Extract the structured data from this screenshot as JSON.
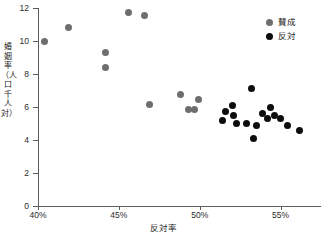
{
  "chart_data": {
    "type": "scatter",
    "title": "",
    "xlabel": "反対率",
    "ylabel": "婚姻率（人口千人対）",
    "xlim": [
      40,
      57.5
    ],
    "ylim": [
      0,
      12
    ],
    "grid": false,
    "legend_position": "top-right",
    "x_ticks": [
      "40%",
      "45%",
      "50%",
      "55%"
    ],
    "x_tick_values": [
      40,
      45,
      50,
      55
    ],
    "y_ticks": [
      "0",
      "2",
      "4",
      "6",
      "8",
      "10",
      "12"
    ],
    "y_tick_values": [
      0,
      2,
      4,
      6,
      8,
      10,
      12
    ],
    "series": [
      {
        "name": "賛成",
        "color": "#6e6e6e",
        "marker": "circle",
        "points": [
          {
            "x": 40.4,
            "y": 10.0
          },
          {
            "x": 41.9,
            "y": 10.8
          },
          {
            "x": 44.2,
            "y": 9.3
          },
          {
            "x": 44.2,
            "y": 8.4
          },
          {
            "x": 45.6,
            "y": 11.7
          },
          {
            "x": 46.6,
            "y": 11.55
          },
          {
            "x": 46.9,
            "y": 6.15
          },
          {
            "x": 48.8,
            "y": 6.75
          },
          {
            "x": 49.3,
            "y": 5.85
          },
          {
            "x": 49.7,
            "y": 5.85
          },
          {
            "x": 49.9,
            "y": 6.45
          }
        ]
      },
      {
        "name": "反対",
        "color": "#0d0d0d",
        "marker": "circle",
        "points": [
          {
            "x": 51.4,
            "y": 5.2
          },
          {
            "x": 51.6,
            "y": 5.7
          },
          {
            "x": 52.0,
            "y": 6.1
          },
          {
            "x": 52.1,
            "y": 5.5
          },
          {
            "x": 52.3,
            "y": 5.0
          },
          {
            "x": 52.9,
            "y": 5.0
          },
          {
            "x": 53.2,
            "y": 7.1
          },
          {
            "x": 53.3,
            "y": 4.1
          },
          {
            "x": 53.5,
            "y": 4.9
          },
          {
            "x": 53.9,
            "y": 5.6
          },
          {
            "x": 54.2,
            "y": 5.3
          },
          {
            "x": 54.4,
            "y": 6.0
          },
          {
            "x": 54.6,
            "y": 5.5
          },
          {
            "x": 55.0,
            "y": 5.3
          },
          {
            "x": 55.4,
            "y": 4.9
          },
          {
            "x": 56.2,
            "y": 4.6
          }
        ]
      }
    ]
  },
  "legend": {
    "items": [
      {
        "label": "賛成",
        "color": "#6e6e6e"
      },
      {
        "label": "反対",
        "color": "#0d0d0d"
      }
    ]
  },
  "axes": {
    "x_title": "反対率",
    "y_title": "婚姻率（人口千人対）"
  }
}
